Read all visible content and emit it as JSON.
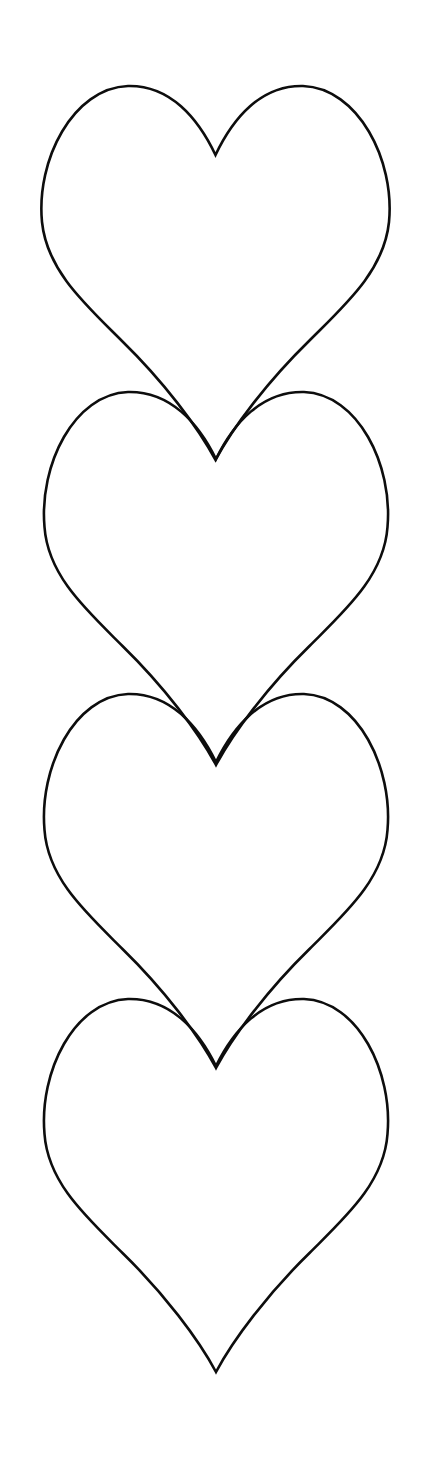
{
  "document": {
    "title": "Heart Outline Template",
    "kind": "printable-shape-template",
    "background_color": "#ffffff",
    "canvas": {
      "width": 427,
      "height": 1462
    }
  },
  "style": {
    "stroke_color": "#0d0d0d",
    "stroke_width_px": 2.6,
    "fill": "none"
  },
  "shapes": {
    "name": "heart-outline-column",
    "count": 4,
    "arrangement": "vertical-overlapping-column",
    "items": [
      {
        "id": "heart-1",
        "label": "Heart 1",
        "center_x": 215.5,
        "top_y": 85,
        "bottom_tip_y": 460,
        "left_x": 41,
        "right_x": 390,
        "width": 349,
        "height": 375,
        "cleft_y": 155,
        "lobe_peak_left_x": 128,
        "lobe_peak_right_x": 303
      },
      {
        "id": "heart-2",
        "label": "Heart 2",
        "center_x": 216,
        "top_y": 391,
        "bottom_tip_y": 765,
        "left_x": 44,
        "right_x": 388,
        "width": 344,
        "height": 374,
        "cleft_y": 459,
        "lobe_peak_left_x": 128,
        "lobe_peak_right_x": 303
      },
      {
        "id": "heart-3",
        "label": "Heart 3",
        "center_x": 216,
        "top_y": 693,
        "bottom_tip_y": 1068,
        "left_x": 44,
        "right_x": 388,
        "width": 344,
        "height": 375,
        "cleft_y": 762,
        "lobe_peak_left_x": 128,
        "lobe_peak_right_x": 303
      },
      {
        "id": "heart-4",
        "label": "Heart 4",
        "center_x": 216,
        "top_y": 998,
        "bottom_tip_y": 1372,
        "left_x": 44,
        "right_x": 387,
        "width": 343,
        "height": 374,
        "cleft_y": 1066,
        "lobe_peak_left_x": 128,
        "lobe_peak_right_x": 303
      }
    ]
  },
  "geometry": {
    "heart_path": "M 216 375 C 200 344 168 300 130 262 C 96 228 60 196 46 152 C 28 96 70 40 128 40 C 168 40 198 64 216 98 C 234 64 264 40 304 40 C 362 40 404 96 386 152 C 372 196 336 228 302 262 C 264 300 232 344 216 375 Z",
    "view_box": "0 0 432 380",
    "vertical_pitch": 304,
    "margins": {
      "top": 85,
      "bottom": 90,
      "left": 41,
      "right": 37
    }
  }
}
